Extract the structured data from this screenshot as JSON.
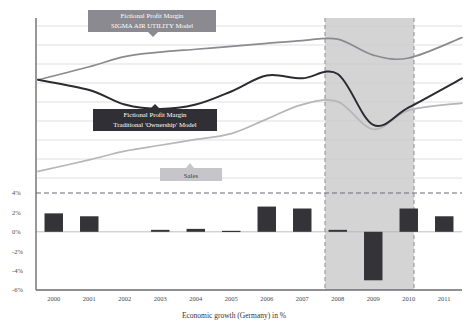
{
  "chart_data": {
    "type": "bar",
    "title": "",
    "xlabel": "Economic growth (Germany) in %",
    "ylabel": "",
    "categories": [
      "2000",
      "2001",
      "2002",
      "2003",
      "2004",
      "2005",
      "2006",
      "2007",
      "2008",
      "2009",
      "2010",
      "2011"
    ],
    "values": [
      1.9,
      1.6,
      0.0,
      0.2,
      0.3,
      0.1,
      2.6,
      2.4,
      0.2,
      -5.0,
      2.4,
      1.6
    ],
    "ylim": [
      -6,
      4
    ],
    "yticks": [
      "4%",
      "2%",
      "0%",
      "-2%",
      "-4%",
      "-6%"
    ],
    "ytick_values": [
      4,
      2,
      0,
      -2,
      -4,
      -6
    ],
    "grid": true,
    "legend_position": "inline-annotations",
    "bar_color": "#333338",
    "series": [
      {
        "name": "Fictional Profit Margin SIGMA AIR UTILITY Model",
        "type": "line",
        "color": "#8a8a90",
        "x": [
          2000,
          2001,
          2002,
          2003,
          2004,
          2005,
          2006,
          2007,
          2008,
          2009,
          2010,
          2011
        ],
        "values": [
          7.3,
          8.2,
          8.9,
          9.2,
          9.4,
          9.6,
          9.8,
          10.0,
          10.1,
          9.0,
          8.8,
          10.2
        ]
      },
      {
        "name": "Fictional Profit Margin Traditional 'Ownership' Model",
        "type": "line",
        "color": "#2b2b31",
        "x": [
          2000,
          2001,
          2002,
          2003,
          2004,
          2005,
          2006,
          2007,
          2008,
          2009,
          2010,
          2011
        ],
        "values": [
          7.3,
          6.6,
          5.6,
          5.3,
          5.6,
          6.5,
          7.6,
          7.4,
          7.7,
          4.2,
          5.4,
          7.4
        ]
      },
      {
        "name": "Sales",
        "type": "line",
        "color": "#b6b6bb",
        "x": [
          2000,
          2001,
          2002,
          2003,
          2004,
          2005,
          2006,
          2007,
          2008,
          2009,
          2010,
          2011
        ],
        "values": [
          1.0,
          1.8,
          2.4,
          2.8,
          3.2,
          3.6,
          4.6,
          5.6,
          5.8,
          3.9,
          5.2,
          5.7
        ]
      }
    ],
    "annotations": [
      {
        "name": "sigma-air-utility-label",
        "line1": "Fictional Profit Margin",
        "line2": "SIGMA AIR UTILITY Model",
        "background": "#8a8a90",
        "text_color": "#ffffff"
      },
      {
        "name": "traditional-ownership-label",
        "line1": "Fictional Profit Margin",
        "line2": "Traditional 'Ownership' Model",
        "background": "#2f2f35",
        "text_color": "#ffffff"
      },
      {
        "name": "sales-label",
        "line1": "Sales",
        "line2": "",
        "background": "#c6c6ca",
        "text_color": "#3a3a40"
      }
    ],
    "shaded_region": {
      "label": "",
      "from": "2008",
      "to": "2010",
      "color": "#d4d4d4"
    },
    "threshold_line": {
      "value": 4,
      "style": "dashed",
      "color": "#6b6b72"
    }
  }
}
